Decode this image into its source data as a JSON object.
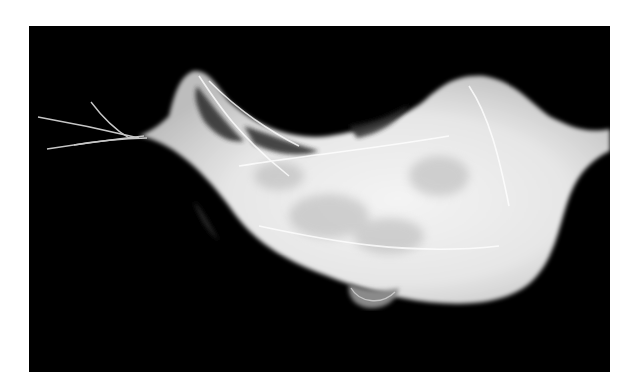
{
  "image": {
    "subject": "silk cocoon",
    "description": "White silken cocoon / egg sac suspended on strands against a black background",
    "colors": {
      "page_background": "#ffffff",
      "photo_background": "#000000",
      "silk": "#f2f2f2",
      "silk_shadow": "#9a9a9a"
    }
  }
}
